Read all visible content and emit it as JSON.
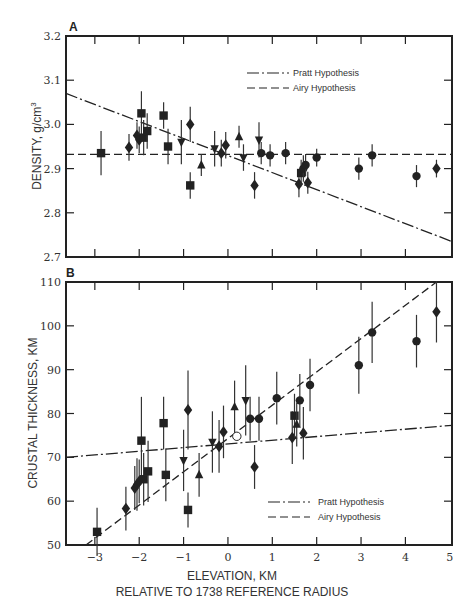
{
  "chart_data": [
    {
      "panel": "A",
      "type": "scatter",
      "xlabel": "ELEVATION, KM",
      "ylabel": "DENSITY, g/cm³",
      "xlim": [
        -3.65,
        5.05
      ],
      "ylim": [
        2.7,
        3.2
      ],
      "yticks": [
        "3.2",
        "3.1",
        "3.0",
        "2.9",
        "2.8",
        "2.7"
      ],
      "legend": [
        {
          "label": "Pratt Hypothesis",
          "style": "dash-dot"
        },
        {
          "label": "Airy Hypothesis",
          "style": "dashed"
        }
      ],
      "lines": [
        {
          "name": "Pratt Hypothesis",
          "x": [
            -3.65,
            5.05
          ],
          "y": [
            3.07,
            2.735
          ]
        },
        {
          "name": "Airy Hypothesis",
          "x": [
            -3.65,
            5.05
          ],
          "y": [
            2.932,
            2.932
          ]
        }
      ],
      "points": [
        {
          "x": -2.86,
          "y": 2.935,
          "err": 0.05,
          "marker": "square"
        },
        {
          "x": -2.23,
          "y": 2.948,
          "err": 0.03,
          "marker": "diamond"
        },
        {
          "x": -2.05,
          "y": 2.975,
          "err": 0.03,
          "marker": "diamond"
        },
        {
          "x": -2.0,
          "y": 2.965,
          "err": 0.03,
          "marker": "diamond"
        },
        {
          "x": -1.95,
          "y": 3.025,
          "err": 0.05,
          "marker": "square"
        },
        {
          "x": -1.9,
          "y": 2.97,
          "err": 0.04,
          "marker": "square"
        },
        {
          "x": -1.82,
          "y": 2.985,
          "err": 0.04,
          "marker": "square"
        },
        {
          "x": -1.45,
          "y": 3.02,
          "err": 0.03,
          "marker": "square"
        },
        {
          "x": -1.35,
          "y": 2.95,
          "err": 0.04,
          "marker": "square"
        },
        {
          "x": -1.05,
          "y": 2.96,
          "err": 0.05,
          "marker": "triangle-down"
        },
        {
          "x": -0.85,
          "y": 3.0,
          "err": 0.04,
          "marker": "diamond"
        },
        {
          "x": -0.85,
          "y": 2.862,
          "err": 0.03,
          "marker": "square"
        },
        {
          "x": -0.6,
          "y": 2.908,
          "err": 0.025,
          "marker": "triangle-up"
        },
        {
          "x": -0.3,
          "y": 2.945,
          "err": 0.04,
          "marker": "triangle-down"
        },
        {
          "x": -0.15,
          "y": 2.935,
          "err": 0.03,
          "marker": "diamond"
        },
        {
          "x": -0.05,
          "y": 2.953,
          "err": 0.03,
          "marker": "diamond"
        },
        {
          "x": 0.25,
          "y": 2.972,
          "err": 0.025,
          "marker": "triangle-up"
        },
        {
          "x": 0.35,
          "y": 2.925,
          "err": 0.03,
          "marker": "triangle-down"
        },
        {
          "x": 0.7,
          "y": 2.965,
          "err": 0.04,
          "marker": "triangle-down"
        },
        {
          "x": 0.6,
          "y": 2.862,
          "err": 0.03,
          "marker": "diamond"
        },
        {
          "x": 0.75,
          "y": 2.935,
          "err": 0.025,
          "marker": "circle"
        },
        {
          "x": 0.95,
          "y": 2.93,
          "err": 0.025,
          "marker": "circle"
        },
        {
          "x": 1.3,
          "y": 2.935,
          "err": 0.025,
          "marker": "circle"
        },
        {
          "x": 1.6,
          "y": 2.865,
          "err": 0.03,
          "marker": "diamond"
        },
        {
          "x": 1.65,
          "y": 2.89,
          "err": 0.03,
          "marker": "square"
        },
        {
          "x": 1.7,
          "y": 2.9,
          "err": 0.03,
          "marker": "circle"
        },
        {
          "x": 1.75,
          "y": 2.908,
          "err": 0.025,
          "marker": "circle"
        },
        {
          "x": 1.8,
          "y": 2.868,
          "err": 0.025,
          "marker": "diamond"
        },
        {
          "x": 2.0,
          "y": 2.925,
          "err": 0.02,
          "marker": "circle"
        },
        {
          "x": 2.95,
          "y": 2.9,
          "err": 0.025,
          "marker": "circle"
        },
        {
          "x": 3.25,
          "y": 2.93,
          "err": 0.025,
          "marker": "circle"
        },
        {
          "x": 4.25,
          "y": 2.883,
          "err": 0.025,
          "marker": "circle"
        },
        {
          "x": 4.7,
          "y": 2.9,
          "err": 0.02,
          "marker": "diamond"
        }
      ]
    },
    {
      "panel": "B",
      "type": "scatter",
      "xlabel": "ELEVATION, KM",
      "xlabel2": "RELATIVE TO 1738 REFERENCE RADIUS",
      "ylabel": "CRUSTAL THICKNESS, KM",
      "xlim": [
        -3.65,
        5.05
      ],
      "ylim": [
        50,
        110
      ],
      "xticks": [
        "-3",
        "-2",
        "-1",
        "0",
        "1",
        "2",
        "3",
        "4",
        "5"
      ],
      "yticks": [
        "110",
        "100",
        "90",
        "80",
        "70",
        "60",
        "50"
      ],
      "legend": [
        {
          "label": "Pratt Hypothesis",
          "style": "dash-dot"
        },
        {
          "label": "Airy Hypothesis",
          "style": "dashed"
        }
      ],
      "lines": [
        {
          "name": "Pratt Hypothesis",
          "x": [
            -3.65,
            5.05
          ],
          "y": [
            70,
            77.3
          ]
        },
        {
          "name": "Airy Hypothesis",
          "x": [
            -3.2,
            4.7
          ],
          "y": [
            50,
            110
          ]
        }
      ],
      "points": [
        {
          "x": -2.95,
          "y": 53,
          "err": 5.5,
          "marker": "square"
        },
        {
          "x": -2.3,
          "y": 58.3,
          "err": 5,
          "marker": "diamond"
        },
        {
          "x": -2.1,
          "y": 63,
          "err": 5,
          "marker": "diamond"
        },
        {
          "x": -2.05,
          "y": 63.8,
          "err": 6,
          "marker": "diamond"
        },
        {
          "x": -2.0,
          "y": 64.5,
          "err": 5,
          "marker": "diamond"
        },
        {
          "x": -1.95,
          "y": 73.8,
          "err": 10,
          "marker": "square"
        },
        {
          "x": -1.9,
          "y": 65,
          "err": 6,
          "marker": "square"
        },
        {
          "x": -1.8,
          "y": 66.8,
          "err": 7,
          "marker": "square"
        },
        {
          "x": -1.45,
          "y": 77.8,
          "err": 6,
          "marker": "square"
        },
        {
          "x": -1.4,
          "y": 66,
          "err": 6,
          "marker": "square"
        },
        {
          "x": -1.0,
          "y": 69.3,
          "err": 7,
          "marker": "triangle-down"
        },
        {
          "x": -0.9,
          "y": 80.8,
          "err": 9,
          "marker": "diamond"
        },
        {
          "x": -0.9,
          "y": 58,
          "err": 4,
          "marker": "square"
        },
        {
          "x": -0.65,
          "y": 66,
          "err": 5,
          "marker": "triangle-up"
        },
        {
          "x": -0.35,
          "y": 73.5,
          "err": 7,
          "marker": "triangle-down"
        },
        {
          "x": -0.2,
          "y": 72.5,
          "err": 6,
          "marker": "diamond"
        },
        {
          "x": -0.1,
          "y": 75.8,
          "err": 6,
          "marker": "diamond"
        },
        {
          "x": 0.15,
          "y": 81.5,
          "err": 6,
          "marker": "triangle-up"
        },
        {
          "x": 0.2,
          "y": 74.8,
          "err": 0,
          "marker": "open-circle"
        },
        {
          "x": 0.4,
          "y": 83,
          "err": 8,
          "marker": "triangle-down"
        },
        {
          "x": 0.5,
          "y": 78.8,
          "err": 5,
          "marker": "circle"
        },
        {
          "x": 0.7,
          "y": 78.8,
          "err": 5,
          "marker": "circle"
        },
        {
          "x": 0.6,
          "y": 67.8,
          "err": 5,
          "marker": "diamond"
        },
        {
          "x": 1.1,
          "y": 83.5,
          "err": 6,
          "marker": "circle"
        },
        {
          "x": 1.45,
          "y": 74.5,
          "err": 6,
          "marker": "diamond"
        },
        {
          "x": 1.5,
          "y": 79.5,
          "err": 5,
          "marker": "square"
        },
        {
          "x": 1.55,
          "y": 77.5,
          "err": 5,
          "marker": "triangle-up"
        },
        {
          "x": 1.62,
          "y": 83,
          "err": 6,
          "marker": "circle"
        },
        {
          "x": 1.7,
          "y": 75.5,
          "err": 6,
          "marker": "diamond"
        },
        {
          "x": 1.85,
          "y": 86.5,
          "err": 6,
          "marker": "circle"
        },
        {
          "x": 2.95,
          "y": 91,
          "err": 6.5,
          "marker": "circle"
        },
        {
          "x": 3.25,
          "y": 98.5,
          "err": 7,
          "marker": "circle"
        },
        {
          "x": 4.25,
          "y": 96.5,
          "err": 6,
          "marker": "circle"
        },
        {
          "x": 4.7,
          "y": 103.2,
          "err": 7,
          "marker": "diamond"
        }
      ]
    }
  ],
  "panels": {
    "a": {
      "label": "A",
      "ylabel": "DENSITY, g/cm",
      "ylabel_sup": "3",
      "legend_pratt": "Pratt Hypothesis",
      "legend_airy": "Airy Hypothesis",
      "yticks": [
        "3.2",
        "3.1",
        "3.0",
        "2.9",
        "2.8",
        "2.7"
      ]
    },
    "b": {
      "label": "B",
      "ylabel": "CRUSTAL THICKNESS, KM",
      "legend_pratt": "Pratt Hypothesis",
      "legend_airy": "Airy Hypothesis",
      "yticks": [
        "110",
        "100",
        "90",
        "80",
        "70",
        "60",
        "50"
      ]
    }
  },
  "xaxis": {
    "ticks": [
      "−3",
      "−2",
      "−1",
      "0",
      "1",
      "2",
      "3",
      "4",
      "5"
    ],
    "label1": "ELEVATION, KM",
    "label2": "RELATIVE TO 1738 REFERENCE RADIUS"
  }
}
